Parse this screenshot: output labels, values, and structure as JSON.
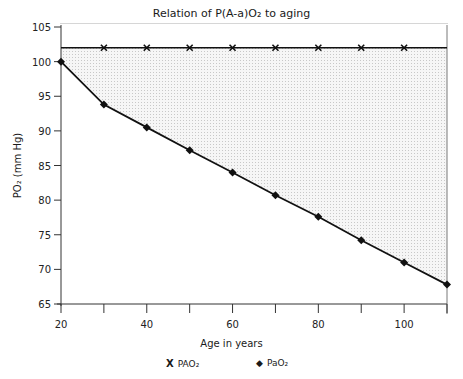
{
  "chart_data": {
    "type": "line",
    "title": "Relation of P(A-a)O₂ to aging",
    "xlabel": "Age in years",
    "ylabel": "PO₂ (mm Hg)",
    "xlim": [
      20,
      110
    ],
    "ylim": [
      65,
      105
    ],
    "x_ticks": [
      20,
      40,
      60,
      80,
      100
    ],
    "y_ticks": [
      65,
      70,
      75,
      80,
      85,
      90,
      95,
      100,
      105
    ],
    "x": [
      20,
      30,
      40,
      50,
      60,
      70,
      80,
      90,
      100,
      110
    ],
    "series": [
      {
        "name": "PAO₂",
        "marker": "x",
        "values": [
          102,
          102,
          102,
          102,
          102,
          102,
          102,
          102,
          102,
          102
        ],
        "marker_ages": [
          30,
          40,
          50,
          60,
          70,
          80,
          90,
          100
        ]
      },
      {
        "name": "PaO₂",
        "marker": "diamond",
        "values": [
          100,
          93.8,
          90.5,
          87.2,
          84,
          80.7,
          77.6,
          74.2,
          71,
          67.8
        ]
      }
    ],
    "shaded_region": "area between PAO₂ and PaO₂ lines (alveolar-arterial gradient)",
    "grid": false,
    "legend_position": "bottom"
  },
  "labels": {
    "title": "Relation of P(A-a)O₂ to aging",
    "xlabel": "Age in years",
    "ylabel": "PO₂ (mm Hg)",
    "legend": [
      {
        "symbol": "X",
        "label": "PAO₂"
      },
      {
        "symbol": "◆",
        "label": "PaO₂"
      }
    ]
  }
}
